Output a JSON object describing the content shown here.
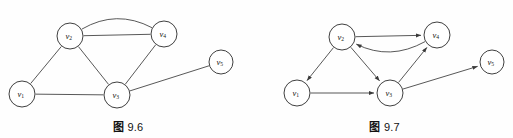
{
  "page": {
    "background_color": "#fefefe",
    "stroke_color": "#3a3a3a",
    "node_fill": "#ffffff",
    "node_stroke": "#2a2a2a"
  },
  "figures": [
    {
      "id": "figure-left",
      "caption_label": "图",
      "caption_number": "9.6",
      "caption_full": "图 9.6",
      "graph_type": "undirected-multigraph",
      "directed": false,
      "nodes": [
        {
          "id": "v1",
          "label": "v",
          "subscript": "1",
          "cx": 22,
          "cy": 94,
          "r": 13
        },
        {
          "id": "v2",
          "label": "v",
          "subscript": "2",
          "cx": 70,
          "cy": 36,
          "r": 13
        },
        {
          "id": "v3",
          "label": "v",
          "subscript": "3",
          "cx": 117,
          "cy": 95,
          "r": 13
        },
        {
          "id": "v4",
          "label": "v",
          "subscript": "4",
          "cx": 164,
          "cy": 34,
          "r": 13
        },
        {
          "id": "v5",
          "label": "v",
          "subscript": "5",
          "cx": 221,
          "cy": 62,
          "r": 12
        }
      ],
      "edges": [
        {
          "from": "v1",
          "to": "v2",
          "shape": "straight",
          "arrow": false
        },
        {
          "from": "v1",
          "to": "v3",
          "shape": "straight",
          "arrow": false
        },
        {
          "from": "v2",
          "to": "v3",
          "shape": "straight",
          "arrow": false
        },
        {
          "from": "v2",
          "to": "v4",
          "shape": "straight",
          "arrow": false
        },
        {
          "from": "v2",
          "to": "v4",
          "shape": "curved",
          "curve": -26,
          "arrow": false
        },
        {
          "from": "v3",
          "to": "v4",
          "shape": "straight",
          "arrow": false
        },
        {
          "from": "v3",
          "to": "v5",
          "shape": "straight",
          "arrow": false
        }
      ]
    },
    {
      "id": "figure-right",
      "caption_label": "图",
      "caption_number": "9.7",
      "caption_full": "图 9.7",
      "graph_type": "directed-graph",
      "directed": true,
      "nodes": [
        {
          "id": "v1",
          "label": "v",
          "subscript": "1",
          "cx": 41,
          "cy": 93,
          "r": 13
        },
        {
          "id": "v2",
          "label": "v",
          "subscript": "2",
          "cx": 86,
          "cy": 37,
          "r": 13
        },
        {
          "id": "v3",
          "label": "v",
          "subscript": "3",
          "cx": 134,
          "cy": 93,
          "r": 13
        },
        {
          "id": "v4",
          "label": "v",
          "subscript": "4",
          "cx": 181,
          "cy": 35,
          "r": 13
        },
        {
          "id": "v5",
          "label": "v",
          "subscript": "5",
          "cx": 236,
          "cy": 62,
          "r": 12
        }
      ],
      "edges": [
        {
          "from": "v2",
          "to": "v1",
          "shape": "straight",
          "arrow": true
        },
        {
          "from": "v2",
          "to": "v3",
          "shape": "straight",
          "arrow": true
        },
        {
          "from": "v2",
          "to": "v4",
          "shape": "straight",
          "arrow": true
        },
        {
          "from": "v4",
          "to": "v2",
          "shape": "curved",
          "curve": -25,
          "arrow": true
        },
        {
          "from": "v1",
          "to": "v3",
          "shape": "straight",
          "arrow": true
        },
        {
          "from": "v3",
          "to": "v4",
          "shape": "straight",
          "arrow": true
        },
        {
          "from": "v3",
          "to": "v5",
          "shape": "straight",
          "arrow": true
        }
      ]
    }
  ]
}
